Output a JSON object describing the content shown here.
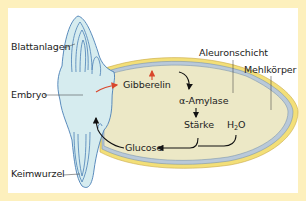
{
  "diagram": {
    "labels": {
      "blattanlagen": "Blattanlagen",
      "embryo": "Embryo",
      "keimwurzel": "Keimwurzel",
      "aleuronschicht": "Aleuronschicht",
      "mehlkoerper": "Mehlkörper",
      "gibberelin": "Gibberelin",
      "amylase": "α-Amylase",
      "staerke": "Stärke",
      "h2o_main": "H",
      "h2o_sub": "2",
      "h2o_tail": "O",
      "glucose": "Glucose"
    },
    "colors": {
      "border": "#fdf0bd",
      "panel": "#ffffff",
      "embryo_fill": "#d6ecef",
      "embryo_outline": "#4a7fb5",
      "seed_outer": "#f3df78",
      "seed_aleurone": "#b9c9d9",
      "seed_endosperm": "#ece8c6",
      "arrow_red": "#d9462b",
      "arrow_black": "#111111"
    }
  }
}
